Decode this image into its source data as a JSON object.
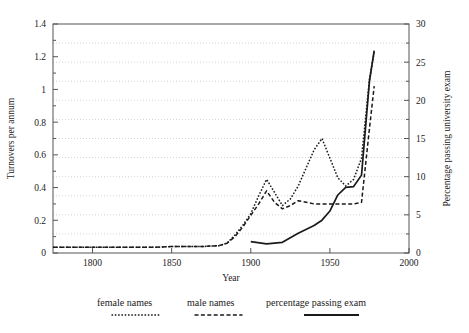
{
  "chart_data": {
    "type": "line",
    "title": "",
    "subtitle": "",
    "xlabel": "Year",
    "ylabel": "Turnovers per annum",
    "y2label": "Percentage passing university exam",
    "xlim": [
      1775,
      2000
    ],
    "ylim": [
      0,
      1.4
    ],
    "y2lim": [
      0,
      30
    ],
    "xticks": [
      1800,
      1850,
      1900,
      1950,
      2000
    ],
    "xtick_labels": [
      "1800",
      "1850",
      "1900",
      "1950",
      "2000"
    ],
    "yticks": [
      0,
      0.2,
      0.4,
      0.6,
      0.8,
      1,
      1.2,
      1.4
    ],
    "ytick_labels": [
      "0",
      "0.2",
      "0.4",
      "0.6",
      "0.8",
      "1",
      "1.2",
      "1.4"
    ],
    "y2ticks": [
      0,
      5,
      10,
      15,
      20,
      25,
      30
    ],
    "y2tick_labels": [
      "0",
      "5",
      "10",
      "15",
      "20",
      "25",
      "30"
    ],
    "grid": "horizontal-dotted",
    "legend_position": "below",
    "series": [
      {
        "name": "female names",
        "style": "dotted",
        "axis": "left",
        "color": "#1a1a1a",
        "x": [
          1775,
          1790,
          1800,
          1810,
          1820,
          1830,
          1840,
          1850,
          1860,
          1870,
          1880,
          1885,
          1890,
          1895,
          1900,
          1905,
          1910,
          1915,
          1920,
          1925,
          1930,
          1935,
          1940,
          1945,
          1950,
          1955,
          1960,
          1965,
          1970,
          1975,
          1978
        ],
        "y": [
          0.035,
          0.035,
          0.035,
          0.035,
          0.035,
          0.035,
          0.035,
          0.04,
          0.04,
          0.04,
          0.045,
          0.06,
          0.11,
          0.17,
          0.24,
          0.35,
          0.45,
          0.37,
          0.29,
          0.33,
          0.41,
          0.52,
          0.63,
          0.7,
          0.58,
          0.46,
          0.41,
          0.45,
          0.58,
          1.06,
          1.23
        ]
      },
      {
        "name": "male names",
        "style": "dashed",
        "axis": "left",
        "color": "#1a1a1a",
        "x": [
          1775,
          1790,
          1800,
          1810,
          1820,
          1830,
          1840,
          1850,
          1860,
          1870,
          1880,
          1885,
          1890,
          1895,
          1900,
          1905,
          1910,
          1915,
          1920,
          1925,
          1930,
          1935,
          1940,
          1945,
          1950,
          1955,
          1960,
          1965,
          1970,
          1975,
          1978
        ],
        "y": [
          0.035,
          0.035,
          0.035,
          0.035,
          0.035,
          0.035,
          0.035,
          0.04,
          0.04,
          0.04,
          0.045,
          0.06,
          0.1,
          0.16,
          0.23,
          0.3,
          0.38,
          0.31,
          0.27,
          0.29,
          0.32,
          0.31,
          0.3,
          0.3,
          0.3,
          0.3,
          0.3,
          0.3,
          0.31,
          0.76,
          1.02
        ]
      },
      {
        "name": "percentage passing exam",
        "style": "solid",
        "axis": "right",
        "color": "#1a1a1a",
        "x": [
          1900,
          1910,
          1920,
          1930,
          1940,
          1945,
          1950,
          1955,
          1960,
          1965,
          1970,
          1975,
          1978
        ],
        "y": [
          1.5,
          1.2,
          1.4,
          2.6,
          3.6,
          4.3,
          5.5,
          7.6,
          8.6,
          8.7,
          10.2,
          22.5,
          26.5
        ]
      }
    ],
    "legend": [
      {
        "label": "female names",
        "style": "dotted"
      },
      {
        "label": "male names",
        "style": "dashed"
      },
      {
        "label": "percentage passing exam",
        "style": "solid"
      }
    ]
  },
  "colors": {
    "line": "#1a1a1a",
    "grid": "#c9c9c9",
    "axis": "#555555",
    "background": "#ffffff"
  }
}
